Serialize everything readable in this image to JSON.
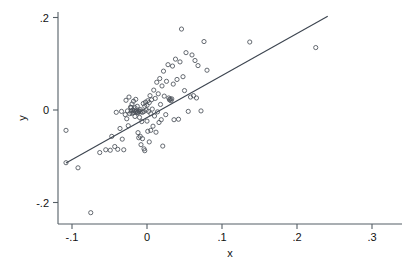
{
  "figure": {
    "kind": "scatter-plot-with-fit-line",
    "background_color": "#ffffff",
    "marker_color": "#4a5058",
    "line_color": "#3d4550",
    "axis_color": "#555f66"
  },
  "labels": {
    "x_axis_title": "x",
    "y_axis_title": "y"
  },
  "chart_data": {
    "type": "scatter",
    "title": "",
    "subtitle": "",
    "xlabel": "x",
    "ylabel": "y",
    "xlim": [
      -0.115,
      0.315
    ],
    "ylim": [
      -0.237,
      0.227
    ],
    "xticks": [
      -0.1,
      0,
      0.1,
      0.2,
      0.3
    ],
    "xticklabels": [
      "-.1",
      "0",
      ".1",
      ".2",
      ".3"
    ],
    "yticks": [
      0.2,
      0,
      -0.2
    ],
    "yticklabels": [
      ".2",
      "0",
      "-.2"
    ],
    "grid": false,
    "legend": null,
    "legend_position": "none",
    "marker_style": "open-circle",
    "marker_size_px": 3.1,
    "annotations": [],
    "fit_line": {
      "type": "line",
      "name": "linear fit",
      "x": [
        -0.108,
        0.241
      ],
      "y": [
        -0.1145,
        0.2025
      ],
      "slope": 0.909,
      "intercept": -0.0164
    },
    "points": [
      [
        -0.108,
        -0.044
      ],
      [
        -0.108,
        -0.114
      ],
      [
        -0.092,
        -0.125
      ],
      [
        -0.075,
        -0.222
      ],
      [
        -0.063,
        -0.092
      ],
      [
        -0.055,
        -0.086
      ],
      [
        -0.049,
        -0.087
      ],
      [
        -0.047,
        -0.057
      ],
      [
        -0.043,
        -0.079
      ],
      [
        -0.041,
        -0.005
      ],
      [
        -0.039,
        -0.085
      ],
      [
        -0.036,
        -0.04
      ],
      [
        -0.034,
        -0.003
      ],
      [
        -0.033,
        -0.063
      ],
      [
        -0.031,
        -0.086
      ],
      [
        -0.029,
        -0.01
      ],
      [
        -0.028,
        0.021
      ],
      [
        -0.027,
        -0.019
      ],
      [
        -0.026,
        -0.002
      ],
      [
        -0.025,
        -0.034
      ],
      [
        -0.024,
        0.028
      ],
      [
        -0.023,
        -0.008
      ],
      [
        -0.022,
        0.006
      ],
      [
        -0.021,
        0.005
      ],
      [
        -0.021,
        -0.002
      ],
      [
        -0.02,
        0.013
      ],
      [
        -0.02,
        -0.007
      ],
      [
        -0.019,
        0.0
      ],
      [
        -0.018,
        -0.005
      ],
      [
        -0.018,
        0.019
      ],
      [
        -0.017,
        -0.001
      ],
      [
        -0.016,
        -0.014
      ],
      [
        -0.016,
        0.005
      ],
      [
        -0.015,
        -0.004
      ],
      [
        -0.015,
        0.023
      ],
      [
        -0.014,
        -0.002
      ],
      [
        -0.013,
        -0.005
      ],
      [
        -0.013,
        0.008
      ],
      [
        -0.012,
        -0.006
      ],
      [
        -0.012,
        -0.049
      ],
      [
        -0.011,
        -0.003
      ],
      [
        -0.011,
        -0.06
      ],
      [
        -0.01,
        -0.002
      ],
      [
        -0.01,
        -0.016
      ],
      [
        -0.009,
        0.001
      ],
      [
        -0.009,
        -0.057
      ],
      [
        -0.008,
        -0.004
      ],
      [
        -0.008,
        -0.075
      ],
      [
        -0.007,
        -0.025
      ],
      [
        -0.006,
        -0.005
      ],
      [
        -0.006,
        -0.062
      ],
      [
        -0.005,
        0.014
      ],
      [
        -0.004,
        -0.003
      ],
      [
        -0.004,
        -0.084
      ],
      [
        -0.003,
        0.008
      ],
      [
        -0.003,
        -0.088
      ],
      [
        -0.002,
        0.017
      ],
      [
        -0.001,
        0.0
      ],
      [
        0.0,
        0.01
      ],
      [
        0.0,
        -0.024
      ],
      [
        0.001,
        0.02
      ],
      [
        0.001,
        -0.046
      ],
      [
        0.002,
        -0.003
      ],
      [
        0.003,
        0.016
      ],
      [
        0.003,
        -0.069
      ],
      [
        0.004,
        0.031
      ],
      [
        0.005,
        -0.008
      ],
      [
        0.005,
        -0.044
      ],
      [
        0.006,
        0.022
      ],
      [
        0.007,
        0.002
      ],
      [
        0.008,
        -0.035
      ],
      [
        0.009,
        0.043
      ],
      [
        0.01,
        -0.013
      ],
      [
        0.011,
        0.025
      ],
      [
        0.012,
        -0.048
      ],
      [
        0.013,
        0.06
      ],
      [
        0.014,
        -0.004
      ],
      [
        0.015,
        0.035
      ],
      [
        0.016,
        -0.027
      ],
      [
        0.017,
        0.068
      ],
      [
        0.018,
        0.012
      ],
      [
        0.019,
        -0.021
      ],
      [
        0.02,
        0.052
      ],
      [
        0.021,
        -0.078
      ],
      [
        0.022,
        0.084
      ],
      [
        0.023,
        0.03
      ],
      [
        0.025,
        -0.01
      ],
      [
        0.026,
        0.062
      ],
      [
        0.028,
        0.098
      ],
      [
        0.029,
        0.026
      ],
      [
        0.03,
        0.022
      ],
      [
        0.031,
        0.024
      ],
      [
        0.032,
        0.02
      ],
      [
        0.033,
        0.024
      ],
      [
        0.034,
        0.095
      ],
      [
        0.035,
        0.056
      ],
      [
        0.036,
        -0.021
      ],
      [
        0.038,
        0.11
      ],
      [
        0.04,
        0.066
      ],
      [
        0.042,
        -0.02
      ],
      [
        0.044,
        0.104
      ],
      [
        0.046,
        0.175
      ],
      [
        0.048,
        0.072
      ],
      [
        0.05,
        0.042
      ],
      [
        0.052,
        0.124
      ],
      [
        0.055,
        -0.003
      ],
      [
        0.058,
        0.028
      ],
      [
        0.06,
        0.119
      ],
      [
        0.062,
        0.031
      ],
      [
        0.064,
        0.107
      ],
      [
        0.066,
        0.026
      ],
      [
        0.068,
        0.096
      ],
      [
        0.072,
        -0.002
      ],
      [
        0.076,
        0.148
      ],
      [
        0.08,
        0.086
      ],
      [
        0.137,
        0.147
      ],
      [
        0.225,
        0.135
      ]
    ]
  }
}
